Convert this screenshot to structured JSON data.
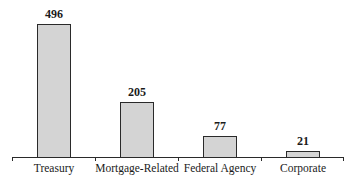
{
  "chart_data": {
    "type": "bar",
    "title": "",
    "xlabel": "",
    "ylabel": "",
    "categories": [
      "Treasury",
      "Mortgage-Related",
      "Federal Agency",
      "Corporate"
    ],
    "values": [
      496,
      205,
      77,
      21
    ],
    "value_labels": [
      "496",
      "205",
      "77",
      "21"
    ],
    "ylim": [
      0,
      520
    ],
    "grid": false,
    "legend": null,
    "bar_color": "#d4d4d4",
    "edge_color": "#2a2a2a"
  }
}
